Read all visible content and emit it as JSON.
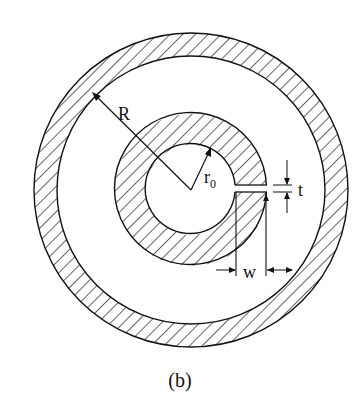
{
  "figure": {
    "caption": "(b)",
    "labels": {
      "outer_radius": "R",
      "inner_radius": "r",
      "inner_radius_sub": "0",
      "slot_thickness": "t",
      "gap_width": "w"
    },
    "colors": {
      "stroke": "#111111",
      "background": "#ffffff"
    }
  }
}
